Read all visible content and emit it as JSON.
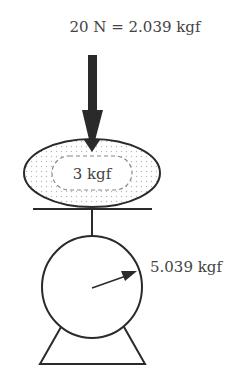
{
  "force_label": "20 N = 2.039 kgf",
  "object_label": "3 kgf",
  "scale_reading_label": "5.039 kgf",
  "colors": {
    "stroke": "#2a2a2a",
    "arrow": "#2a2a2a",
    "dots": "#b8b8b8",
    "dashed": "#888888",
    "text": "#444444"
  }
}
